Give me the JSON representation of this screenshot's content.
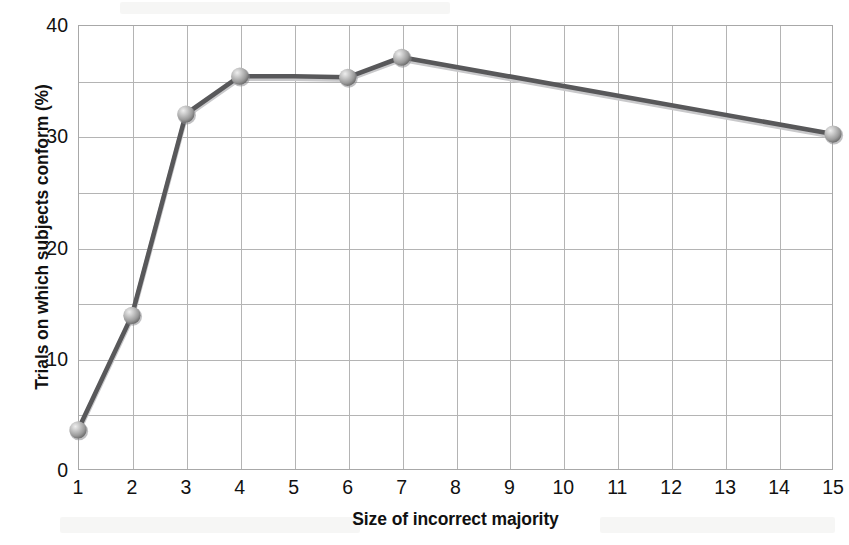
{
  "chart_data": {
    "type": "line",
    "title": "",
    "subtitle": "",
    "xlabel": "Size of incorrect majority",
    "ylabel": "Trials on which subjects conform (%)",
    "xlim": [
      1,
      15
    ],
    "ylim": [
      0,
      40
    ],
    "x_ticks": [
      1,
      2,
      3,
      4,
      5,
      6,
      7,
      8,
      9,
      10,
      11,
      12,
      13,
      14,
      15
    ],
    "x_tick_labels": [
      "1",
      "2",
      "3",
      "4",
      "5",
      "6",
      "7",
      "8",
      "9",
      "10",
      "11",
      "12",
      "13",
      "14",
      "15"
    ],
    "y_ticks": [
      0,
      10,
      20,
      30,
      40
    ],
    "y_tick_labels": [
      "0",
      "10",
      "20",
      "30",
      "40"
    ],
    "y_gridlines": [
      0,
      5,
      10,
      15,
      20,
      25,
      30,
      35,
      40
    ],
    "x_gridlines": [
      1,
      2,
      3,
      4,
      5,
      6,
      7,
      8,
      9,
      10,
      11,
      12,
      13,
      14,
      15
    ],
    "grid": true,
    "legend": false,
    "legend_position": "none",
    "series": [
      {
        "name": "Conformity rate",
        "line_color": "#58585a",
        "marker_color": "#a8a8a8",
        "marker_shape": "sphere",
        "x": [
          1,
          2,
          3,
          4,
          5,
          6,
          7,
          15
        ],
        "values": [
          3.6,
          13.9,
          32.0,
          35.4,
          35.4,
          35.3,
          37.1,
          30.2
        ],
        "marker_x": [
          1,
          2,
          3,
          4,
          6,
          7,
          15
        ],
        "marker_values": [
          3.6,
          13.9,
          32.0,
          35.4,
          35.3,
          37.1,
          30.2
        ]
      }
    ],
    "annotations": []
  },
  "axes": {
    "y_title": "Trials on which subjects conform (%)",
    "x_title": "Size of incorrect majority"
  },
  "colors": {
    "line": "#58585a",
    "marker_light": "#d8d8d8",
    "marker_mid": "#a9a9a9",
    "marker_dark": "#7c7c7c",
    "grid": "#b4b4b4",
    "frame": "#a8a8a8",
    "text": "#111111",
    "background": "#ffffff"
  }
}
